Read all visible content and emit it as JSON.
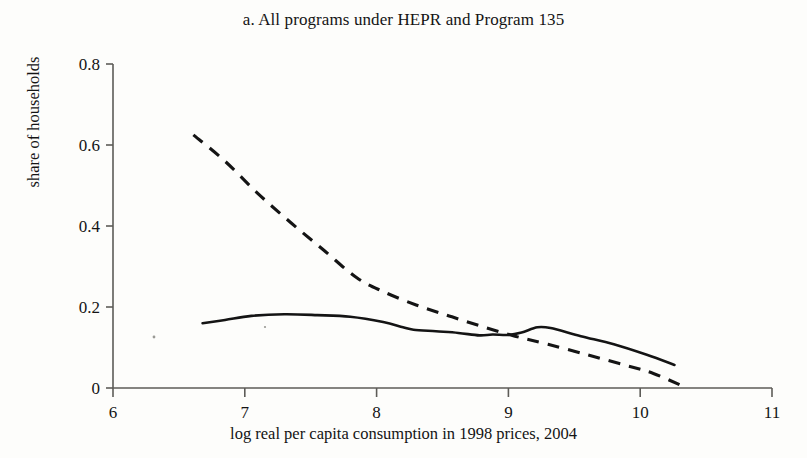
{
  "figure": {
    "panel_label": "a.",
    "title": "a. All programs under HEPR and Program 135"
  },
  "axes": {
    "xlabel": "log real per capita consumption in 1998 prices, 2004",
    "ylabel": "share of households",
    "x_ticks": [
      "6",
      "7",
      "8",
      "9",
      "10",
      "11"
    ],
    "y_ticks": [
      "0",
      "0.2",
      "0.4",
      "0.6",
      "0.8"
    ]
  },
  "chart_data": {
    "type": "line",
    "title": "a. All programs under HEPR and Program 135",
    "xlabel": "log real per capita consumption in 1998 prices, 2004",
    "ylabel": "share of households",
    "xlim": [
      6,
      11
    ],
    "ylim": [
      0,
      0.8
    ],
    "xticks": [
      6,
      7,
      8,
      9,
      10,
      11
    ],
    "yticks": [
      0,
      0.2,
      0.4,
      0.6,
      0.8
    ],
    "grid": false,
    "legend": "none",
    "series": [
      {
        "name": "solid-line",
        "style": "solid",
        "color": "#141414",
        "x": [
          6.68,
          6.85,
          7.05,
          7.3,
          7.55,
          7.8,
          8.05,
          8.2,
          8.28,
          8.45,
          8.62,
          8.78,
          8.88,
          9.0,
          9.1,
          9.22,
          9.32,
          9.55,
          9.8,
          10.05,
          10.26
        ],
        "y": [
          0.16,
          0.168,
          0.178,
          0.182,
          0.18,
          0.176,
          0.163,
          0.15,
          0.144,
          0.14,
          0.136,
          0.13,
          0.132,
          0.131,
          0.137,
          0.15,
          0.148,
          0.128,
          0.108,
          0.082,
          0.057
        ]
      },
      {
        "name": "dashed-line",
        "style": "dashed",
        "color": "#141414",
        "x": [
          6.61,
          6.85,
          7.1,
          7.35,
          7.6,
          7.85,
          8.05,
          8.3,
          8.55,
          8.8,
          9.05,
          9.3,
          9.6,
          9.9,
          10.1,
          10.32
        ],
        "y": [
          0.625,
          0.56,
          0.48,
          0.408,
          0.34,
          0.272,
          0.238,
          0.205,
          0.178,
          0.152,
          0.128,
          0.108,
          0.082,
          0.055,
          0.036,
          0.005
        ]
      }
    ]
  },
  "plot_geometry": {
    "left_px": 113,
    "right_px": 772,
    "bottom_px": 388,
    "top_px": 64
  }
}
